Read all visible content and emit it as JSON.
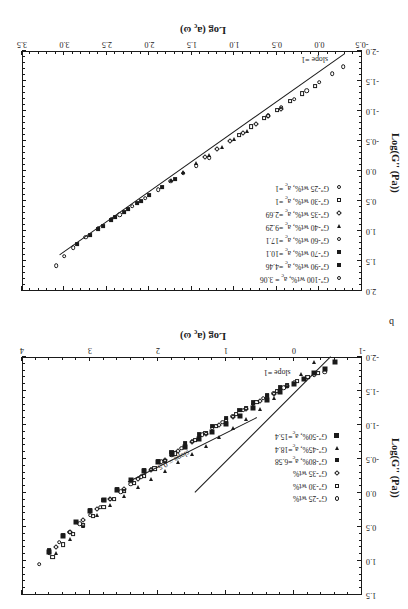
{
  "figure": {
    "panel_b_letter": "b",
    "background": "#ffffff",
    "ink": "#1a1a1a"
  },
  "panel_top": {
    "name": "panel-b",
    "letter": "b",
    "xlabel_main": "Log (a",
    "xlabel_sub": "c",
    "xlabel_tail": " ω)",
    "ylabel": "Log(G''  (Pa))",
    "x_ticks": [
      "-1",
      "0",
      "1",
      "2",
      "3",
      "4"
    ],
    "y_ticks": [
      "-2.0",
      "-1.5",
      "-1.0",
      "-0.5",
      "0.0",
      "0.5",
      "1.0",
      "1.5"
    ],
    "annotations": [
      {
        "text": "slope = 0.5"
      },
      {
        "text": "slope =1"
      }
    ],
    "legend": [
      {
        "label": "G''-25 wt%",
        "marker": "open-circle"
      },
      {
        "label": "G''-30 wt%",
        "marker": "open-square"
      },
      {
        "label": "G''-35 wt%",
        "marker": "open-diamond"
      },
      {
        "label": "G''-80%,  a",
        "sub": "c",
        "tail": "=6.58",
        "marker": "filled-square"
      },
      {
        "label": "G''-45%,  a",
        "sub": "c",
        "tail": "=18.4",
        "marker": "filled-triangle"
      },
      {
        "label": "G''-50%,  a",
        "sub": "c",
        "tail": "=15.4",
        "marker": "filled-square-big"
      }
    ]
  },
  "panel_bottom": {
    "name": "panel-a",
    "xlabel_main": "Log (a",
    "xlabel_sub": "c",
    "xlabel_tail": " ω)",
    "ylabel": "Log(G''  (Pa))",
    "x_ticks": [
      "-0.5",
      "0.0",
      "0.5",
      "1.0",
      "1.5",
      "2.0",
      "2.5",
      "3.0",
      "3.5"
    ],
    "y_ticks": [
      "-2.0",
      "-1.5",
      "-1.0",
      "-0.5",
      "0.0",
      "0.5",
      "1.0",
      "1.5",
      "2.0"
    ],
    "annotations": [
      {
        "text": "slope =1"
      }
    ],
    "legend": [
      {
        "label": "G''-100 wt%, a",
        "sub": "c",
        "tail": " = 3.06",
        "marker": "open-circle"
      },
      {
        "label": "G''-90 wt%, a",
        "sub": "c",
        "tail": " =4.46",
        "marker": "filled-square"
      },
      {
        "label": "G''-70 wt%, a",
        "sub": "c",
        "tail": " =10.1",
        "marker": "filled-square"
      },
      {
        "label": "G''-60 wt%, a",
        "sub": "c",
        "tail": " =17.1",
        "marker": "open-circle"
      },
      {
        "label": "G''-40 wt%, a",
        "sub": "c",
        "tail": " =9.29",
        "marker": "filled-triangle"
      },
      {
        "label": "G''-35 wt%, a",
        "sub": "c",
        "tail": " =2.69",
        "marker": "open-diamond"
      },
      {
        "label": "G''-30 wt%, a",
        "sub": "c",
        "tail": " =1",
        "marker": "open-square"
      },
      {
        "label": "G''-25 wt%, a",
        "sub": "c",
        "tail": " =1",
        "marker": "open-circle"
      }
    ]
  },
  "chart_data": [
    {
      "id": "panel-b",
      "type": "scatter",
      "title": "",
      "xlabel": "Log (a_c ω)",
      "ylabel": "Log(G'' (Pa))",
      "xlim": [
        -1,
        4
      ],
      "ylim": [
        -2.0,
        1.5
      ],
      "xticks": [
        -1,
        0,
        1,
        2,
        3,
        4
      ],
      "yticks": [
        -2.0,
        -1.5,
        -1.0,
        -0.5,
        0.0,
        0.5,
        1.0,
        1.5
      ],
      "grid": false,
      "legend_position": "left-inside",
      "annotations": [
        {
          "text": "slope = 0.5",
          "x": 1.55,
          "y": -0.55,
          "rotation": 27
        },
        {
          "text": "slope =1",
          "x": 0.05,
          "y": -1.72,
          "rotation": 0
        }
      ],
      "reference_lines": [
        {
          "label": "slope = 0.5",
          "slope": 0.5,
          "x": [
            0.55,
            2.45
          ],
          "y": [
            -1.1,
            -0.15
          ]
        },
        {
          "label": "slope =1",
          "slope": 1.0,
          "x": [
            -0.55,
            1.45
          ],
          "y": [
            -2.0,
            0.0
          ]
        }
      ],
      "series": [
        {
          "name": "G''-25 wt%",
          "marker": "open-circle",
          "x": [
            -0.45,
            -0.3,
            -0.15,
            0.0,
            0.15,
            0.3,
            0.45,
            0.6,
            0.75,
            0.9,
            1.05,
            1.2,
            1.35,
            1.5,
            1.65,
            1.8,
            1.95,
            2.1,
            2.25,
            2.4,
            2.55,
            2.7,
            2.85,
            3.0,
            3.15,
            3.3,
            3.45,
            3.6,
            3.75
          ],
          "y": [
            -1.78,
            -1.73,
            -1.67,
            -1.62,
            -1.55,
            -1.47,
            -1.39,
            -1.31,
            -1.22,
            -1.13,
            -1.04,
            -0.95,
            -0.86,
            -0.76,
            -0.66,
            -0.56,
            -0.46,
            -0.35,
            -0.24,
            -0.13,
            -0.02,
            0.09,
            0.21,
            0.33,
            0.45,
            0.58,
            0.72,
            0.88,
            1.05
          ]
        },
        {
          "name": "G''-30 wt%",
          "marker": "open-square",
          "x": [
            -0.35,
            -0.2,
            -0.05,
            0.1,
            0.25,
            0.4,
            0.55,
            0.7,
            0.85,
            1.0,
            1.15,
            1.3,
            1.45,
            1.6,
            1.75,
            1.9,
            2.05,
            2.2,
            2.35,
            2.5,
            2.65,
            2.8,
            2.95,
            3.1,
            3.25,
            3.4,
            3.55
          ],
          "y": [
            -1.76,
            -1.7,
            -1.64,
            -1.58,
            -1.5,
            -1.42,
            -1.34,
            -1.25,
            -1.16,
            -1.07,
            -0.98,
            -0.88,
            -0.78,
            -0.68,
            -0.58,
            -0.47,
            -0.36,
            -0.25,
            -0.14,
            -0.03,
            0.09,
            0.21,
            0.34,
            0.47,
            0.61,
            0.76,
            0.94
          ]
        },
        {
          "name": "G''-35 wt%",
          "marker": "open-diamond",
          "x": [
            0.1,
            0.3,
            0.5,
            0.7,
            0.9,
            1.1,
            1.3,
            1.5,
            1.7,
            1.9,
            2.1,
            2.3,
            2.5,
            2.7,
            2.9,
            3.1,
            3.3,
            3.5
          ],
          "y": [
            -1.57,
            -1.46,
            -1.35,
            -1.23,
            -1.12,
            -1.0,
            -0.87,
            -0.75,
            -0.62,
            -0.48,
            -0.34,
            -0.2,
            -0.06,
            0.09,
            0.24,
            0.4,
            0.58,
            0.8
          ]
        },
        {
          "name": "G''-80%, a_c=6.58",
          "marker": "filled-square",
          "x": [
            0.2,
            0.4,
            0.6,
            0.8,
            1.0,
            1.2,
            1.4,
            1.6,
            1.8,
            2.0,
            2.2,
            2.4,
            2.6,
            2.8,
            3.0,
            3.2,
            3.4,
            3.6
          ],
          "y": [
            -1.55,
            -1.44,
            -1.33,
            -1.22,
            -1.1,
            -0.98,
            -0.86,
            -0.73,
            -0.6,
            -0.47,
            -0.33,
            -0.19,
            -0.05,
            0.1,
            0.26,
            0.43,
            0.62,
            0.84
          ]
        },
        {
          "name": "G''-45%, a_c=18.4",
          "marker": "filled-triangle",
          "x": [
            -0.3,
            -0.1,
            0.1,
            0.3,
            0.5,
            0.7,
            0.9,
            1.1,
            1.3,
            1.5,
            1.7,
            1.9,
            2.1,
            2.3,
            2.5,
            2.7,
            2.9,
            3.1,
            3.3,
            3.5
          ],
          "y": [
            -1.93,
            -1.75,
            -1.57,
            -1.4,
            -1.24,
            -1.09,
            -0.95,
            -0.82,
            -0.69,
            -0.57,
            -0.45,
            -0.33,
            -0.21,
            -0.09,
            0.04,
            0.18,
            0.33,
            0.49,
            0.67,
            0.88
          ]
        },
        {
          "name": "G''-50%, a_c=15.4",
          "marker": "filled-square-big",
          "x": [
            -0.6,
            -0.45,
            -0.3,
            -0.15,
            0.0,
            0.2,
            0.4,
            0.6,
            0.8,
            1.0,
            1.2,
            1.4,
            1.6,
            1.8,
            2.0,
            2.2,
            2.4,
            2.6,
            2.8,
            3.0,
            3.2,
            3.4,
            3.6
          ],
          "y": [
            -1.92,
            -1.83,
            -1.76,
            -1.68,
            -1.6,
            -1.49,
            -1.37,
            -1.25,
            -1.13,
            -1.01,
            -0.9,
            -0.79,
            -0.68,
            -0.57,
            -0.45,
            -0.32,
            -0.19,
            -0.05,
            0.1,
            0.26,
            0.43,
            0.63,
            0.87
          ]
        }
      ]
    },
    {
      "id": "panel-a",
      "type": "scatter",
      "title": "",
      "xlabel": "Log (a_c ω)",
      "ylabel": "Log(G'' (Pa))",
      "xlim": [
        -0.5,
        3.5
      ],
      "ylim": [
        -2.0,
        2.0
      ],
      "xticks": [
        -0.5,
        0.0,
        0.5,
        1.0,
        1.5,
        2.0,
        2.5,
        3.0,
        3.5
      ],
      "yticks": [
        -2.0,
        -1.5,
        -1.0,
        -0.5,
        0.0,
        0.5,
        1.0,
        1.5,
        2.0
      ],
      "grid": false,
      "legend_position": "upper-left-inside",
      "annotations": [
        {
          "text": "slope =1",
          "x": -0.1,
          "y": -1.8,
          "rotation": 0
        }
      ],
      "reference_lines": [
        {
          "label": "slope =1",
          "slope": 1.0,
          "x": [
            -0.3,
            3.05
          ],
          "y": [
            -1.95,
            1.4
          ]
        }
      ],
      "series": [
        {
          "name": "G''-100 wt%, a_c = 3.06",
          "marker": "open-circle",
          "x": [
            2.45,
            2.6,
            2.75,
            2.9,
            3.0,
            3.1
          ],
          "y": [
            0.8,
            0.95,
            1.1,
            1.28,
            1.42,
            1.58
          ]
        },
        {
          "name": "G''-90 wt%, a_c =4.46",
          "marker": "filled-square",
          "x": [
            2.1,
            2.25,
            2.4,
            2.55,
            2.7,
            2.85
          ],
          "y": [
            0.5,
            0.63,
            0.77,
            0.92,
            1.07,
            1.22
          ]
        },
        {
          "name": "G''-70 wt%, a_c =10.1",
          "marker": "filled-square",
          "x": [
            1.7,
            1.85,
            2.0,
            2.15,
            2.3,
            2.45,
            2.6
          ],
          "y": [
            0.14,
            0.27,
            0.4,
            0.54,
            0.68,
            0.82,
            0.97
          ]
        },
        {
          "name": "G''-60 wt%, a_c =17.1",
          "marker": "open-circle",
          "x": [
            1.3,
            1.45,
            1.6,
            1.75,
            1.9,
            2.05,
            2.2,
            2.35
          ],
          "y": [
            -0.22,
            -0.09,
            0.04,
            0.17,
            0.31,
            0.45,
            0.59,
            0.73
          ]
        },
        {
          "name": "G''-40 wt%, a_c =9.29",
          "marker": "filled-triangle",
          "x": [
            0.85,
            1.0,
            1.15,
            1.3,
            1.45,
            1.6,
            1.75
          ],
          "y": [
            -0.66,
            -0.53,
            -0.4,
            -0.27,
            -0.13,
            0.01,
            0.15
          ]
        },
        {
          "name": "G''-35 wt%, a_c =2.69",
          "marker": "open-diamond",
          "x": [
            0.45,
            0.6,
            0.75,
            0.9,
            1.05,
            1.2,
            1.35
          ],
          "y": [
            -1.04,
            -0.91,
            -0.78,
            -0.64,
            -0.5,
            -0.37,
            -0.23
          ]
        },
        {
          "name": "G''-30 wt%, a_c =1",
          "marker": "open-square",
          "x": [
            0.05,
            0.2,
            0.35,
            0.5,
            0.65,
            0.8,
            0.95
          ],
          "y": [
            -1.42,
            -1.29,
            -1.16,
            -1.02,
            -0.88,
            -0.74,
            -0.6
          ]
        },
        {
          "name": "G''-25 wt%, a_c =1",
          "marker": "open-circle",
          "x": [
            -0.28,
            -0.15,
            0.0,
            0.15,
            0.3,
            0.45,
            0.6
          ],
          "y": [
            -1.74,
            -1.62,
            -1.48,
            -1.34,
            -1.2,
            -1.06,
            -0.92
          ]
        }
      ]
    }
  ]
}
